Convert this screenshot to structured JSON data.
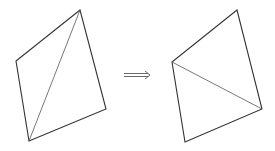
{
  "diagram": {
    "type": "edge-flip",
    "left_quad": {
      "vertices": [
        [
          80,
          10
        ],
        [
          16,
          61
        ],
        [
          29,
          141
        ],
        [
          106,
          109
        ]
      ],
      "diagonal": [
        [
          80,
          10
        ],
        [
          29,
          141
        ]
      ]
    },
    "arrow": {
      "symbol": "⟹",
      "from": [
        124,
        75
      ],
      "to": [
        150,
        75
      ]
    },
    "right_quad": {
      "vertices": [
        [
          237,
          10
        ],
        [
          172,
          62
        ],
        [
          185,
          142
        ],
        [
          262,
          109
        ]
      ],
      "diagonal": [
        [
          172,
          62
        ],
        [
          262,
          109
        ]
      ]
    },
    "colors": {
      "edge": "#333333",
      "diagonal": "#555555",
      "background": "#ffffff"
    }
  }
}
